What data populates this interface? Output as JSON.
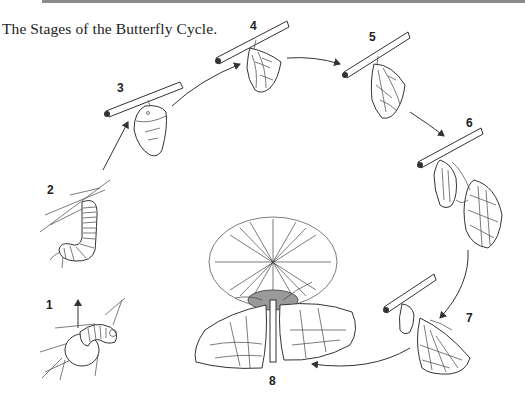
{
  "title": "The Stages of the Butterfly Cycle.",
  "stages": [
    {
      "number": "1",
      "description": "egg with hatching caterpillar"
    },
    {
      "number": "2",
      "description": "caterpillar on twig"
    },
    {
      "number": "3",
      "description": "chrysalis forming"
    },
    {
      "number": "4",
      "description": "chrysalis"
    },
    {
      "number": "5",
      "description": "chrysalis becoming transparent"
    },
    {
      "number": "6",
      "description": "butterfly emerging"
    },
    {
      "number": "7",
      "description": "butterfly drying wings"
    },
    {
      "number": "8",
      "description": "adult butterfly on flower"
    }
  ],
  "colors": {
    "ink": "#333333",
    "rule": "#8a8a8a",
    "background": "#ffffff"
  }
}
